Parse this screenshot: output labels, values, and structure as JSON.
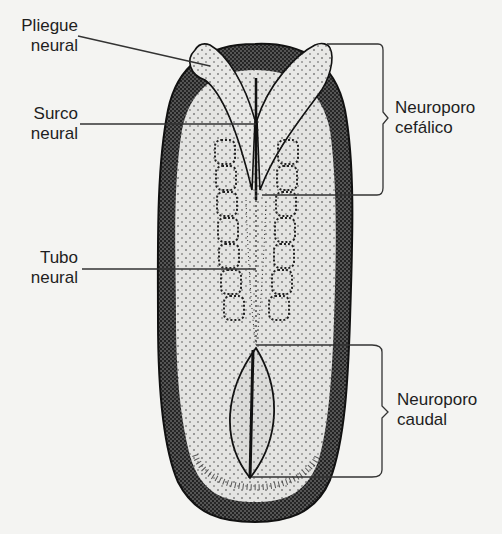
{
  "diagram": {
    "colors": {
      "background": "#f4f4f2",
      "ink": "#1e1e1e",
      "fill": "#e4e4e2",
      "stipple": "#2a2a2a"
    },
    "labels": [
      {
        "id": "pliegue",
        "line1": "Pliegue",
        "line2": "neural",
        "side": "left"
      },
      {
        "id": "surco",
        "line1": "Surco",
        "line2": "neural",
        "side": "left"
      },
      {
        "id": "tubo",
        "line1": "Tubo",
        "line2": "neural",
        "side": "left"
      },
      {
        "id": "neuroporo_cefalico",
        "line1": "Neuroporo",
        "line2": "cefálico",
        "side": "right"
      },
      {
        "id": "neuroporo_caudal",
        "line1": "Neuroporo",
        "line2": "caudal",
        "side": "right"
      }
    ]
  }
}
